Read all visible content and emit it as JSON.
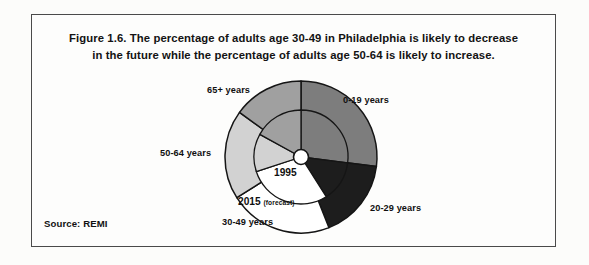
{
  "figure": {
    "title_line_1": "Figure 1.6. The percentage of adults age 30-49 in Philadelphia is likely to decrease",
    "title_line_2": "in the future while the percentage of adults age 50-64 is likely to increase.",
    "source": "Source: REMI",
    "border_color": "#4a4a4a",
    "page_background": "#fdfdfc"
  },
  "ring_labels": {
    "inner_year": "1995",
    "outer_year": "2015",
    "outer_qualifier": "(forecast)"
  },
  "chart_data": {
    "type": "pie",
    "title": "Figure 1.6. The percentage of adults age 30-49 in Philadelphia is likely to decrease in the future while the percentage of adults age 50-64 is likely to increase.",
    "xlabel": "",
    "ylabel": "",
    "legend_position": "callout-labels-around-chart",
    "grid": false,
    "start_angle_deg": 0,
    "direction": "clockwise",
    "categories": [
      "0-19 years",
      "20-29 years",
      "30-49 years",
      "50-64 years",
      "65+ years"
    ],
    "colors": [
      "#7d7d7d",
      "#1d1d1d",
      "#ffffff",
      "#d2d2d2",
      "#a0a0a0"
    ],
    "series": [
      {
        "name": "2015 (forecast)",
        "ring": "outer",
        "values": [
          27,
          17,
          22,
          19,
          15
        ]
      },
      {
        "name": "1995",
        "ring": "inner",
        "values": [
          27,
          14,
          29,
          13,
          17
        ]
      }
    ]
  },
  "labels": {
    "age_0_19": "0-19 years",
    "age_20_29": "20-29 years",
    "age_30_49": "30-49 years",
    "age_50_64": "50-64 years",
    "age_65_plus": "65+ years"
  }
}
